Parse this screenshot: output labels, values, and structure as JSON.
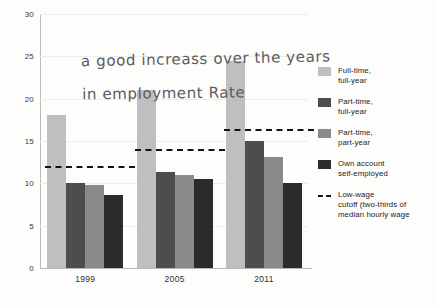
{
  "chart_data": {
    "type": "bar",
    "title": "",
    "xlabel": "",
    "ylabel": "",
    "ylim": [
      0,
      30
    ],
    "ytick_step": 5,
    "yticks": [
      0,
      5,
      10,
      15,
      20,
      25,
      30
    ],
    "grid": true,
    "legend_position": "right",
    "categories": [
      "1999",
      "2005",
      "2011"
    ],
    "series": [
      {
        "name": "Full-time, full-year",
        "color": "#bfbfbf",
        "values": [
          18.1,
          21.0,
          24.5
        ]
      },
      {
        "name": "Part-time, full-year",
        "color": "#4d4d4d",
        "values": [
          10.0,
          11.3,
          15.0
        ]
      },
      {
        "name": "Part-time, part-year",
        "color": "#8a8a8a",
        "values": [
          9.8,
          11.0,
          13.1
        ]
      },
      {
        "name": "Own account self-employed",
        "color": "#2b2b2b",
        "values": [
          8.6,
          10.5,
          10.1
        ]
      }
    ],
    "reference_lines": [
      {
        "name": "Low-wage cutoff",
        "category": "1999",
        "value": 12.0
      },
      {
        "name": "Low-wage cutoff",
        "category": "2005",
        "value": 14.1
      },
      {
        "name": "Low-wage cutoff",
        "category": "2011",
        "value": 16.4
      }
    ],
    "annotations": [
      {
        "name": "handwritten-note",
        "line1": "a good increass over the years",
        "line2": "in employment Rate"
      }
    ]
  },
  "legend": {
    "items": [
      {
        "label_line1": "Full-time,",
        "label_line2": "full-year",
        "swatch": "c0"
      },
      {
        "label_line1": "Part-time,",
        "label_line2": "full-year",
        "swatch": "c1"
      },
      {
        "label_line1": "Part-time,",
        "label_line2": "part-year",
        "swatch": "c2"
      },
      {
        "label_line1": "Own account",
        "label_line2": "self-employed",
        "swatch": "c3"
      },
      {
        "label_line1": "Low-wage",
        "label_line2": "cutoff (two-thirds of median hourly wage",
        "swatch": "dash"
      }
    ]
  },
  "axis": {
    "y_labels": [
      "30",
      "25",
      "20",
      "15",
      "10",
      "5",
      "0"
    ],
    "x_labels": [
      "1999",
      "2005",
      "2011"
    ]
  },
  "annotation": {
    "line1": "a good increass over the years",
    "line2": "in employment Rate"
  }
}
